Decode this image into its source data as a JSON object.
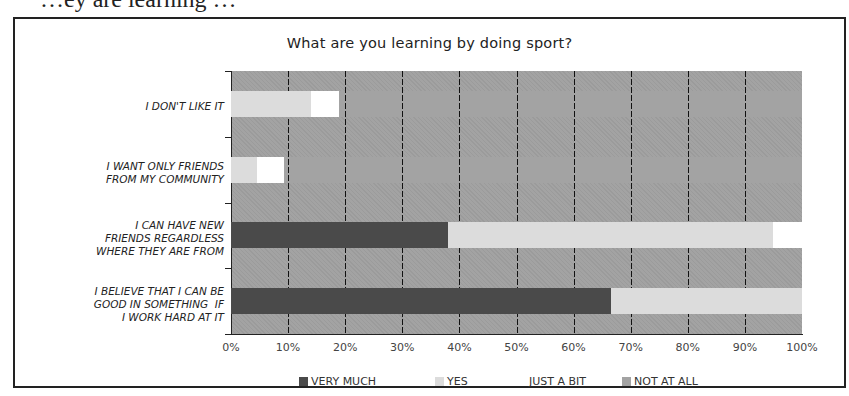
{
  "page": {
    "top_cut_text": "…ey are learning …"
  },
  "chart_data": {
    "type": "bar",
    "orientation": "horizontal",
    "stacked": "100%",
    "title": "What are you learning by doing sport?",
    "xlabel": "",
    "ylabel": "",
    "xlim": [
      0,
      100
    ],
    "x_tick_labels": [
      "0%",
      "10%",
      "20%",
      "30%",
      "40%",
      "50%",
      "60%",
      "70%",
      "80%",
      "90%",
      "100%"
    ],
    "grid": "vertical dashed",
    "legend_position": "bottom",
    "categories": [
      "I DON'T LIKE IT",
      "I WANT ONLY FRIENDS\nFROM MY COMMUNITY",
      "I CAN HAVE NEW\nFRIENDS REGARDLESS\nWHERE THEY ARE FROM",
      "I BELIEVE THAT I CAN BE\nGOOD IN SOMETHING  IF\nI WORK HARD AT IT"
    ],
    "series": [
      {
        "name": "VERY  MUCH",
        "color": "#4a4a4a",
        "values": [
          0,
          0,
          38,
          66.5
        ]
      },
      {
        "name": "YES",
        "color": "#dcdcdc",
        "values": [
          14,
          4.5,
          57,
          33.5
        ]
      },
      {
        "name": "JUST A BIT",
        "color": "#ffffff",
        "values": [
          5,
          4.8,
          5,
          0
        ]
      },
      {
        "name": "NOT AT ALL",
        "color": "#a3a3a3",
        "values": [
          81,
          90.7,
          0,
          0
        ]
      }
    ]
  }
}
